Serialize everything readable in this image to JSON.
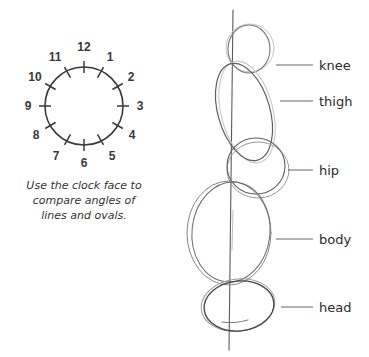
{
  "clock": {
    "numbers": [
      "12",
      "1",
      "2",
      "3",
      "4",
      "5",
      "6",
      "7",
      "8",
      "9",
      "10",
      "11"
    ],
    "caption": {
      "line1": "Use the clock face to",
      "line2": "compare angles of",
      "line3": "lines and ovals."
    }
  },
  "figure": {
    "labels": {
      "knee": "knee",
      "thigh": "thigh",
      "hip": "hip",
      "body": "body",
      "head": "head"
    }
  },
  "colors": {
    "clock_stroke": "#3a3a3a",
    "sketch_stroke": "#555555",
    "sketch_light": "#b0b0b0",
    "leader": "#666666"
  }
}
